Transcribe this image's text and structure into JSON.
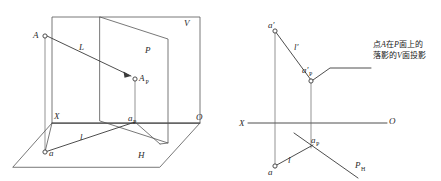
{
  "figure": {
    "background_color": "#ffffff",
    "line_color": "#555555",
    "text_color": "#1a1a1a"
  },
  "left_diagram": {
    "name": "pictorial-axonometric-view",
    "labels": {
      "point_a": "A",
      "line_l_upper": "L",
      "plane_v": "V",
      "plane_p": "P",
      "point_a_p_base": "A",
      "point_a_p_sub": "P",
      "axis_x": "X",
      "axis_o": "O",
      "point_a_lower": "a",
      "point_ap_base": "a",
      "point_ap_sub": "P",
      "line_l_lower": "l",
      "plane_h": "H"
    }
  },
  "right_diagram": {
    "name": "orthographic-projection-view",
    "labels": {
      "a_prime": "a′",
      "l_prime": "l′",
      "a_prime_p_base": "a′",
      "a_prime_p_sub": "P",
      "axis_x": "X",
      "axis_o": "O",
      "ap_base": "a",
      "ap_sub": "P",
      "line_l": "l",
      "point_a": "a",
      "p_h_base": "P",
      "p_h_sub": "H"
    },
    "annotation": {
      "line1_prefix": "点",
      "line1_italic1": "A",
      "line1_mid": "在",
      "line1_italic2": "P",
      "line1_suffix": "面上的",
      "line2_prefix": "落影的",
      "line2_italic": "V",
      "line2_suffix": "面投影",
      "full_text": "点A在P面上的落影的V面投影"
    }
  },
  "caption": {
    "text": ""
  }
}
